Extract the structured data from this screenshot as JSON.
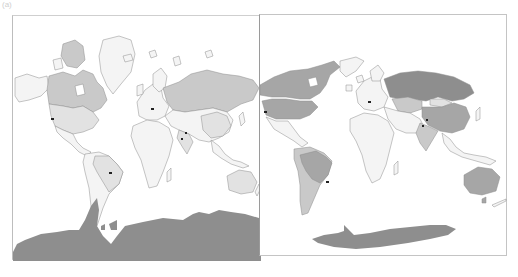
{
  "figure": {
    "corner_label": "(a)",
    "colors": {
      "background": "#ffffff",
      "ocean": "#ffffff",
      "border": "#8c8c8c",
      "level_none": "#f4f4f4",
      "level_low": "#e2e2e2",
      "level_mid": "#c9c9c9",
      "level_high": "#a6a6a6",
      "level_max": "#8e8e8e",
      "marker": "#222222"
    }
  },
  "maps": [
    {
      "id": "left",
      "projection": "Mercator",
      "highlighted_regions": [
        {
          "name": "Canada",
          "shade": "level_mid"
        },
        {
          "name": "Russia",
          "shade": "level_mid"
        },
        {
          "name": "Antarctica",
          "shade": "level_max"
        },
        {
          "name": "Brazil",
          "shade": "level_low"
        },
        {
          "name": "United States",
          "shade": "level_low"
        },
        {
          "name": "China",
          "shade": "level_low"
        },
        {
          "name": "Australia",
          "shade": "level_low"
        },
        {
          "name": "India",
          "shade": "level_low"
        }
      ],
      "markers": [
        {
          "label": "California"
        },
        {
          "label": "Central Europe"
        },
        {
          "label": "Pakistan / NW India"
        },
        {
          "label": "SE Brazil"
        }
      ]
    },
    {
      "id": "right",
      "projection": "Equal-area",
      "highlighted_regions": [
        {
          "name": "Russia",
          "shade": "level_max"
        },
        {
          "name": "Canada",
          "shade": "level_high"
        },
        {
          "name": "United States",
          "shade": "level_high"
        },
        {
          "name": "Brazil",
          "shade": "level_high"
        },
        {
          "name": "China",
          "shade": "level_high"
        },
        {
          "name": "Australia",
          "shade": "level_high"
        },
        {
          "name": "Antarctica",
          "shade": "level_high"
        },
        {
          "name": "Kazakhstan",
          "shade": "level_mid"
        },
        {
          "name": "India",
          "shade": "level_mid"
        },
        {
          "name": "Argentina",
          "shade": "level_mid"
        },
        {
          "name": "Mongolia",
          "shade": "level_low"
        }
      ],
      "markers": [
        {
          "label": "California"
        },
        {
          "label": "Central Europe"
        },
        {
          "label": "Pakistan / NW India"
        },
        {
          "label": "SE Brazil"
        }
      ]
    }
  ]
}
